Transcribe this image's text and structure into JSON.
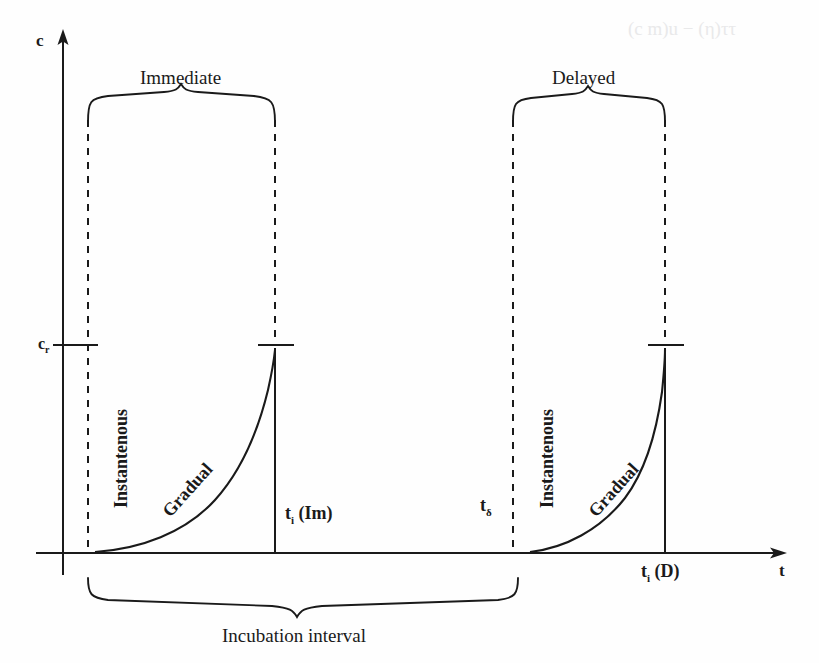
{
  "figure": {
    "type": "schematic-plot",
    "background_color": "#fefefe",
    "ink_color": "#1a1a1a"
  },
  "axes": {
    "y_label": "c",
    "x_label": "t",
    "y_axis_x": 63,
    "x_axis_y": 553,
    "x_axis_end": 785,
    "y_axis_top": 30
  },
  "ticks": [
    {
      "name": "critical-concentration",
      "label": "c",
      "sub": "r",
      "y": 345
    }
  ],
  "groups": [
    {
      "name": "immediate",
      "title": "Immediate",
      "start_x": 88,
      "end_x": 275,
      "brace_y": 110,
      "title_x": 180,
      "title_y": 80,
      "instant_label": "Instantenous",
      "gradual_label": "Gradual",
      "peak_label": "t",
      "peak_sub": "i",
      "peak_suffix": " (Im)",
      "peak_x": 275,
      "peak_y": 350
    },
    {
      "name": "delayed",
      "title": "Delayed",
      "start_x": 513,
      "end_x": 665,
      "brace_y": 110,
      "title_x": 589,
      "title_y": 80,
      "instant_label": "Instantenous",
      "gradual_label": "Gradual",
      "peak_label": "t",
      "peak_sub": "i",
      "peak_suffix": " (D)",
      "peak_x": 665,
      "peak_y": 350
    }
  ],
  "markers": [
    {
      "name": "delay-onset",
      "label": "t",
      "sub": "δ",
      "x": 487,
      "y": 505
    }
  ],
  "bottom_brace": {
    "label": "Incubation interval",
    "start_x": 88,
    "end_x": 518,
    "y": 590,
    "label_x": 303,
    "label_y": 620
  },
  "bleed_through": {
    "text": "(c  m)u − (η)ττ",
    "x": 628,
    "y": 18
  }
}
